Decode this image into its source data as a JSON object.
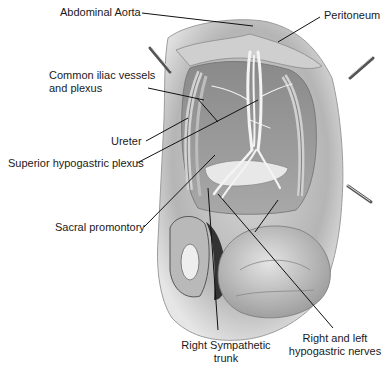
{
  "figure": {
    "type": "anatomical illustration",
    "background": "#ffffff",
    "line_color": "#111111"
  },
  "labels": {
    "abdominal_aorta": "Abdominal Aorta",
    "peritoneum": "Peritoneum",
    "common_iliac_line1": "Common iliac vessels",
    "common_iliac_line2": "and plexus",
    "ureter": "Ureter",
    "superior_hypogastric_plexus": "Superior hypogastric plexus",
    "sacral_promontory": "Sacral promontory",
    "right_sympathetic_line1": "Right Sympathetic",
    "right_sympathetic_line2": "trunk",
    "hypogastric_nerves_line1": "Right and left",
    "hypogastric_nerves_line2": "hypogastric nerves"
  }
}
